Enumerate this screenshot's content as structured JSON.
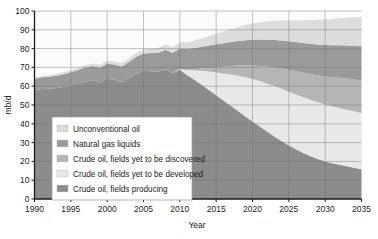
{
  "chart_data": {
    "type": "area",
    "title": "",
    "xlabel": "Year",
    "ylabel": "mb/d",
    "xlim": [
      1990,
      2035
    ],
    "ylim": [
      0,
      100
    ],
    "grid": true,
    "legend_position": "inside-lower-left",
    "xticks": [
      "1990",
      "1995",
      "2000",
      "2005",
      "2010",
      "2015",
      "2020",
      "2025",
      "2030",
      "2035"
    ],
    "yticks": [
      "0",
      "10",
      "20",
      "30",
      "40",
      "50",
      "60",
      "70",
      "80",
      "90",
      "100"
    ],
    "x": [
      1990,
      1991,
      1992,
      1993,
      1994,
      1995,
      1996,
      1997,
      1998,
      1999,
      2000,
      2001,
      2002,
      2003,
      2004,
      2005,
      2006,
      2007,
      2008,
      2009,
      2010,
      2011,
      2012,
      2013,
      2014,
      2015,
      2016,
      2017,
      2018,
      2019,
      2020,
      2021,
      2022,
      2023,
      2024,
      2025,
      2026,
      2027,
      2028,
      2029,
      2030,
      2031,
      2032,
      2033,
      2034,
      2035
    ],
    "stack_order_bottom_to_top": [
      "Crude oil, fields producing",
      "Crude oil, fields yet to be developed",
      "Crude oil, fields yet to be discovered",
      "Natural gas liquids",
      "Unconventional oil"
    ],
    "series": [
      {
        "name": "Crude oil, fields producing",
        "color": "#8c8c8c",
        "values": [
          58.0,
          58.5,
          58.6,
          59.0,
          59.6,
          60.4,
          61.4,
          62.5,
          63.1,
          62.0,
          64.0,
          63.4,
          62.2,
          64.4,
          66.8,
          68.2,
          68.0,
          67.6,
          69.0,
          67.0,
          68.8,
          66.0,
          63.4,
          60.8,
          58.0,
          55.2,
          52.4,
          49.6,
          46.8,
          44.0,
          41.2,
          38.5,
          35.9,
          33.3,
          30.8,
          28.5,
          26.4,
          24.5,
          22.8,
          21.3,
          20.0,
          19.0,
          18.2,
          17.4,
          16.6,
          15.8
        ]
      },
      {
        "name": "Crude oil, fields yet to be developed",
        "color": "#e8e8e8",
        "values": [
          0,
          0,
          0,
          0,
          0,
          0,
          0,
          0,
          0,
          0,
          0,
          0,
          0,
          0,
          0,
          0,
          0,
          0,
          0,
          0,
          0.4,
          2.6,
          5.0,
          7.4,
          9.8,
          12.2,
          14.4,
          16.6,
          18.8,
          20.8,
          22.6,
          24.2,
          25.6,
          26.8,
          27.8,
          28.6,
          29.2,
          29.6,
          29.9,
          30.1,
          30.2,
          30.2,
          30.2,
          30.1,
          30.0,
          29.9
        ]
      },
      {
        "name": "Crude oil, fields yet to be discovered",
        "color": "#b5b5b5",
        "values": [
          0,
          0,
          0,
          0,
          0,
          0,
          0,
          0,
          0,
          0,
          0,
          0,
          0,
          0,
          0,
          0,
          0,
          0,
          0,
          0,
          0,
          0.2,
          0.6,
          1.2,
          1.9,
          2.7,
          3.6,
          4.5,
          5.4,
          6.3,
          7.2,
          8.1,
          9.0,
          9.9,
          10.8,
          11.6,
          12.4,
          13.1,
          13.8,
          14.4,
          15.0,
          15.6,
          16.1,
          16.6,
          17.0,
          17.4
        ]
      },
      {
        "name": "Natural gas liquids",
        "color": "#9a9a9a",
        "values": [
          6.0,
          6.2,
          6.4,
          6.6,
          6.8,
          7.0,
          7.2,
          7.4,
          7.6,
          7.8,
          8.0,
          8.1,
          8.3,
          8.5,
          8.8,
          9.2,
          9.6,
          10.0,
          10.4,
          10.6,
          10.8,
          11.0,
          11.3,
          11.6,
          11.9,
          12.2,
          12.5,
          12.8,
          13.1,
          13.4,
          13.7,
          14.0,
          14.3,
          14.6,
          14.9,
          15.2,
          15.5,
          15.8,
          16.1,
          16.4,
          16.7,
          17.0,
          17.3,
          17.6,
          17.9,
          18.2
        ]
      },
      {
        "name": "Unconventional oil",
        "color": "#dcdcdc",
        "values": [
          0.6,
          0.7,
          0.8,
          0.9,
          1.0,
          1.1,
          1.2,
          1.3,
          1.4,
          1.5,
          1.6,
          1.7,
          1.8,
          1.9,
          2.0,
          2.2,
          2.4,
          2.6,
          2.8,
          3.0,
          3.2,
          3.6,
          4.0,
          4.5,
          5.0,
          5.6,
          6.2,
          6.8,
          7.4,
          8.0,
          8.6,
          9.1,
          9.6,
          10.1,
          10.6,
          11.1,
          11.6,
          12.1,
          12.6,
          13.1,
          13.6,
          14.0,
          14.4,
          14.8,
          15.2,
          15.6
        ]
      }
    ],
    "legend": [
      {
        "label": "Unconventional oil",
        "color": "#dcdcdc"
      },
      {
        "label": "Natural gas liquids",
        "color": "#9a9a9a"
      },
      {
        "label": "Crude oil, fields yet to be discovered",
        "color": "#b5b5b5"
      },
      {
        "label": "Crude oil, fields yet to be developed",
        "color": "#e8e8e8"
      },
      {
        "label": "Crude oil, fields producing",
        "color": "#8c8c8c"
      }
    ]
  }
}
